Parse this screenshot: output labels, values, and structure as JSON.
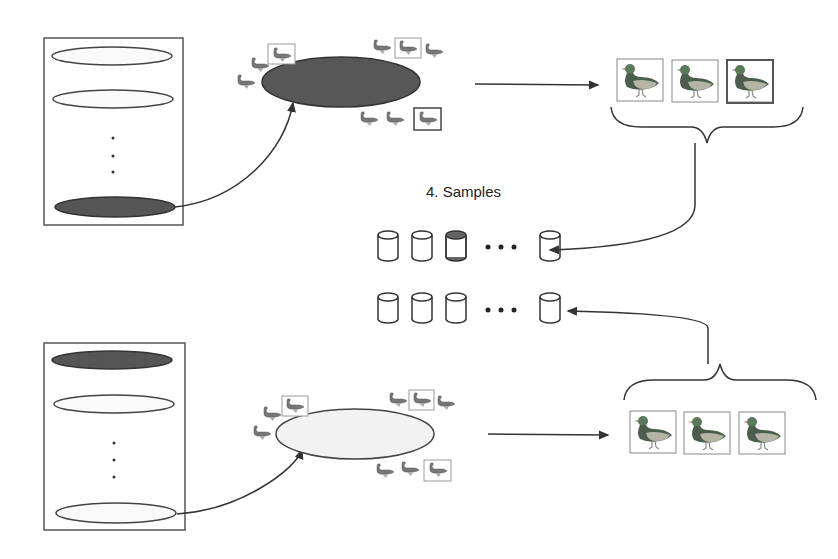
{
  "diagram": {
    "label": "4. Samples",
    "colors": {
      "stroke": "#333333",
      "dark_fill": "#555555",
      "light_fill": "#f4f4f4",
      "duck_head": "#4a6a4a",
      "duck_body": "#9a9a9a"
    },
    "top_group": {
      "stack": {
        "ellipses": [
          {
            "state": "empty"
          },
          {
            "state": "empty"
          },
          {
            "state": "selected-dark"
          }
        ],
        "ellipsis_dots": 3
      },
      "cluster": {
        "fill": "dark",
        "duck_count": 10
      },
      "selected_ducks": 3
    },
    "bottom_group": {
      "stack": {
        "ellipses": [
          {
            "state": "dark"
          },
          {
            "state": "empty"
          },
          {
            "state": "selected-light"
          }
        ],
        "ellipsis_dots": 3
      },
      "cluster": {
        "fill": "light",
        "duck_count": 10
      },
      "selected_ducks": 3
    },
    "sample_rows": [
      {
        "cylinders": 4,
        "highlighted_index": 2,
        "ellipsis": "..."
      },
      {
        "cylinders": 4,
        "highlighted_index": null,
        "ellipsis": "..."
      }
    ]
  }
}
